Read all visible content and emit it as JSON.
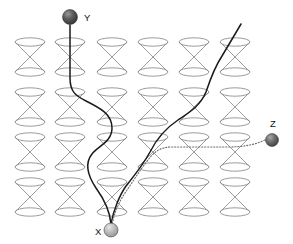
{
  "figure": {
    "background_color": "#ffffff",
    "width": 293,
    "height": 244
  },
  "palette": {
    "cone_stroke": "#8a8a8a",
    "solid_worldline": "#1a1a1a",
    "dotted_worldline": "#6e6e6e",
    "label_color": "#111111",
    "sphere_dark": "#4a4a4a",
    "sphere_mid": "#6b6b6b",
    "sphere_light": "#b5b5b5"
  },
  "lattice": {
    "name": "light-cone-lattice",
    "rows": 4,
    "columns": 6,
    "count": 24,
    "cone_width": 30,
    "cone_height": 30,
    "rim_ry": 4.2,
    "column_x_centers": [
      30,
      70,
      112,
      153,
      194,
      235
    ],
    "row_y_tops": [
      42,
      92,
      137,
      182
    ]
  },
  "nodes": [
    {
      "id": "Y",
      "label": "Y",
      "label_x": 84,
      "label_y": 21,
      "cx": 70,
      "cy": 17,
      "r": 7.5,
      "shade": "dark",
      "description": "upper event sphere"
    },
    {
      "id": "X",
      "label": "X",
      "label_x": 95,
      "label_y": 235,
      "cx": 111,
      "cy": 230,
      "r": 7.0,
      "shade": "light",
      "description": "lower convergence event sphere"
    },
    {
      "id": "Z",
      "label": "Z",
      "label_x": 270,
      "label_y": 127,
      "cx": 272,
      "cy": 140,
      "r": 6.5,
      "shade": "mid",
      "description": "right-side event sphere"
    }
  ],
  "worldlines": [
    {
      "id": "y-to-x",
      "style": "solid",
      "from": "Y",
      "to": "X",
      "path": "M 70,25 L 70,78 C 70,92 76,96 86,101 C 100,108 112,114 112,128 C 112,142 98,146 92,154 C 84,164 88,176 96,188 C 104,199 110,212 111,224"
    },
    {
      "id": "top-right-to-x",
      "style": "solid",
      "from": "top-right-edge",
      "to": "X",
      "path": "M 241,24 C 234,36 228,46 222,56 C 214,68 210,80 206,92 C 200,106 190,112 178,120 C 166,128 156,140 150,152 C 143,165 134,176 126,186 C 119,196 113,212 111,224"
    },
    {
      "id": "z-to-x",
      "style": "dotted",
      "from": "Z",
      "to": "X",
      "path": "M 265,140 C 252,146 240,147 226,147 C 205,147 186,147 172,147 C 160,147 154,152 148,160 C 140,170 134,180 127,190 C 120,200 114,212 112,226"
    }
  ],
  "legend_text": {
    "solid_meaning": "solid worldline",
    "dotted_meaning": "dotted worldline"
  }
}
